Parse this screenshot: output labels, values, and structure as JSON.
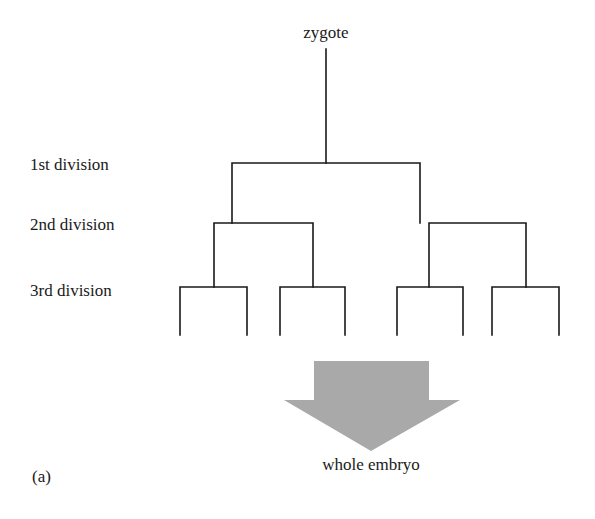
{
  "figure": {
    "panel_label": "(a)",
    "root_label": "zygote",
    "result_label": "whole embryo",
    "level_labels": [
      "1st division",
      "2nd division",
      "3rd division"
    ],
    "arrow_color": "#a9a9a9",
    "line_color": "#1a1a1a"
  }
}
